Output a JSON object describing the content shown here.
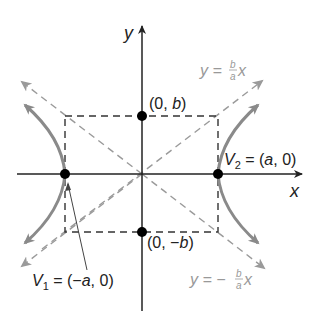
{
  "diagram": {
    "type": "hyperbola",
    "axes": {
      "x_label": "x",
      "y_label": "y"
    },
    "points": {
      "b_top": "(0, b)",
      "b_bottom": "(0, −b)"
    },
    "vertices": {
      "v1": {
        "name": "V",
        "sub": "1",
        "eq": " = (−a, 0)"
      },
      "v2": {
        "name": "V",
        "sub": "2",
        "eq": " = (a, 0)"
      }
    },
    "asymptotes": {
      "positive": {
        "lhs": "y = ",
        "num": "b",
        "den": "a",
        "rhs": "x"
      },
      "negative": {
        "lhs": "y = −",
        "num": "b",
        "den": "a",
        "rhs": "x"
      }
    },
    "colors": {
      "axis": "#222222",
      "curve": "#8a8a8a",
      "asymptote": "#9a9a9a",
      "box": "#333333",
      "point": "#000000",
      "asymptote_label": "#999999"
    }
  }
}
